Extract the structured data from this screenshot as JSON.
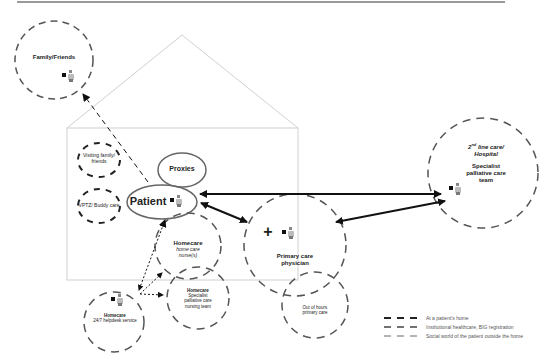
{
  "diagram": {
    "title": "",
    "nodes": {
      "family_friends": {
        "label": "Family/Friends"
      },
      "visiting_family": {
        "label_line1": "Visiting family/",
        "label_line2": "friends"
      },
      "vptz": {
        "label": "VPTZ/ Buddy care"
      },
      "proxies": {
        "label": "Proxies"
      },
      "patient": {
        "label": "Patient"
      },
      "homecare_nurses": {
        "title": "Homecare",
        "line1": "home care",
        "line2": "nurse(s)"
      },
      "homecare_specialist": {
        "title": "Homecare",
        "line1": "Specialist",
        "line2": "palliative care",
        "line3": "nursing team"
      },
      "homecare_helpdesk": {
        "title": "Homecare",
        "line1": "24/7 helpdesk service"
      },
      "primary_care": {
        "line1": "Primary care",
        "line2": "physician",
        "icon_glyph": "+"
      },
      "out_of_hours": {
        "line1": "Out of hours",
        "line2": "primary care"
      },
      "hospital": {
        "line1_sup": "nd",
        "line1_pre": "2",
        "line1_post": " line care/",
        "line2": "Hospital",
        "line3": "Specialist",
        "line4": "palliative care",
        "line5": "team"
      }
    },
    "legend": [
      {
        "style": "thick-dash",
        "label": "At a patient's home"
      },
      {
        "style": "medium-dash",
        "label": "Institutional healthcare, BIG registration"
      },
      {
        "style": "thin-dash",
        "label": "Social world of the patient outside the home"
      }
    ],
    "colors": {
      "line": "#555555",
      "arrow": "#111111",
      "house": "#d0d0d0",
      "top_rule": "#777777"
    }
  }
}
